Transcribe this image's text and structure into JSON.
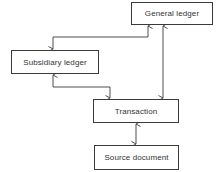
{
  "diagram": {
    "nodes": [
      {
        "id": "general_ledger",
        "label": "General ledger"
      },
      {
        "id": "subsidiary_ledger",
        "label": "Subsidiary ledger"
      },
      {
        "id": "transaction",
        "label": "Transaction"
      },
      {
        "id": "source_document",
        "label": "Source document"
      }
    ],
    "edges": [
      {
        "from": "general_ledger",
        "to": "subsidiary_ledger",
        "direction": "both"
      },
      {
        "from": "subsidiary_ledger",
        "to": "transaction",
        "direction": "both"
      },
      {
        "from": "general_ledger",
        "to": "transaction",
        "direction": "both"
      },
      {
        "from": "transaction",
        "to": "source_document",
        "direction": "both"
      }
    ],
    "colors": {
      "line": "#3a3a3a",
      "text": "#333333",
      "background": "#ffffff"
    }
  }
}
